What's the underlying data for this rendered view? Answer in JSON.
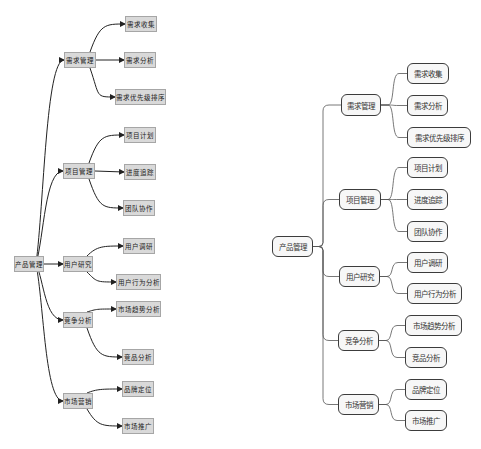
{
  "left_diagram": {
    "style": {
      "node_fill": "#d9d9d9",
      "node_border": "#a6a6a6",
      "edge_color": "#222222"
    },
    "root": {
      "label": "产品管理",
      "box": [
        14,
        256,
        30,
        16
      ]
    },
    "branches": [
      {
        "label": "需求管理",
        "box": [
          64,
          52,
          32,
          16
        ],
        "children": [
          {
            "label": "需求收集",
            "box": [
              125,
              16,
              32,
              16
            ]
          },
          {
            "label": "需求分析",
            "box": [
              124,
              52,
              32,
              16
            ]
          },
          {
            "label": "需求优先级排序",
            "box": [
              115,
              89,
              51,
              16
            ]
          }
        ]
      },
      {
        "label": "项目管理",
        "box": [
          63,
          163,
          32,
          16
        ],
        "children": [
          {
            "label": "项目计划",
            "box": [
              124,
              127,
              32,
              16
            ]
          },
          {
            "label": "进度追踪",
            "box": [
              124,
              164,
              32,
              16
            ]
          },
          {
            "label": "团队协作",
            "box": [
              123,
              200,
              32,
              16
            ]
          }
        ]
      },
      {
        "label": "用户研究",
        "box": [
          63,
          256,
          30,
          16
        ],
        "children": [
          {
            "label": "用户调研",
            "box": [
              123,
              238,
              32,
              16
            ]
          },
          {
            "label": "用户行为分析",
            "box": [
              116,
              274,
              45,
              16
            ]
          }
        ]
      },
      {
        "label": "竞争分析",
        "box": [
          63,
          312,
          30,
          16
        ],
        "children": [
          {
            "label": "市场趋势分析",
            "box": [
              116,
              301,
              45,
              16
            ]
          },
          {
            "label": "竞品分析",
            "box": [
              122,
              349,
              32,
              16
            ]
          }
        ]
      },
      {
        "label": "市场营销",
        "box": [
          63,
          393,
          30,
          16
        ],
        "children": [
          {
            "label": "品牌定位",
            "box": [
              122,
              381,
              32,
              16
            ]
          },
          {
            "label": "市场推广",
            "box": [
              122,
              418,
              32,
              16
            ]
          }
        ]
      }
    ]
  },
  "right_diagram": {
    "style": {
      "node_fill": "#f7f7f7",
      "node_border": "#3c3c3c",
      "edge_color": "#555555"
    },
    "root": {
      "label": "产品管理",
      "box": [
        272,
        236,
        41,
        21
      ]
    },
    "branches": [
      {
        "label": "需求管理",
        "box": [
          341,
          94,
          40,
          22
        ],
        "children": [
          {
            "label": "需求收集",
            "box": [
              407,
              63,
              42,
              21
            ]
          },
          {
            "label": "需求分析",
            "box": [
              407,
              95,
              41,
              21
            ]
          },
          {
            "label": "需求优先级排序",
            "box": [
              407,
              127,
              64,
              21
            ]
          }
        ]
      },
      {
        "label": "项目管理",
        "box": [
          339,
          189,
          42,
          21
        ],
        "children": [
          {
            "label": "项目计划",
            "box": [
              407,
              157,
              41,
              21
            ]
          },
          {
            "label": "进度追踪",
            "box": [
              407,
              189,
              41,
              21
            ]
          },
          {
            "label": "团队协作",
            "box": [
              407,
              221,
              41,
              21
            ]
          }
        ]
      },
      {
        "label": "用户研究",
        "box": [
          339,
          266,
          41,
          21
        ],
        "children": [
          {
            "label": "用户调研",
            "box": [
              407,
              252,
              41,
              21
            ]
          },
          {
            "label": "用户行为分析",
            "box": [
              407,
              283,
              55,
              21
            ]
          }
        ]
      },
      {
        "label": "竞争分析",
        "box": [
          338,
          330,
          41,
          21
        ],
        "children": [
          {
            "label": "市场趋势分析",
            "box": [
              405,
              315,
              57,
              21
            ]
          },
          {
            "label": "竞品分析",
            "box": [
              405,
              347,
              42,
              21
            ]
          }
        ]
      },
      {
        "label": "市场营销",
        "box": [
          338,
          394,
          41,
          21
        ],
        "children": [
          {
            "label": "品牌定位",
            "box": [
              405,
              379,
              42,
              21
            ]
          },
          {
            "label": "市场推广",
            "box": [
              405,
              410,
              42,
              21
            ]
          }
        ]
      }
    ]
  }
}
